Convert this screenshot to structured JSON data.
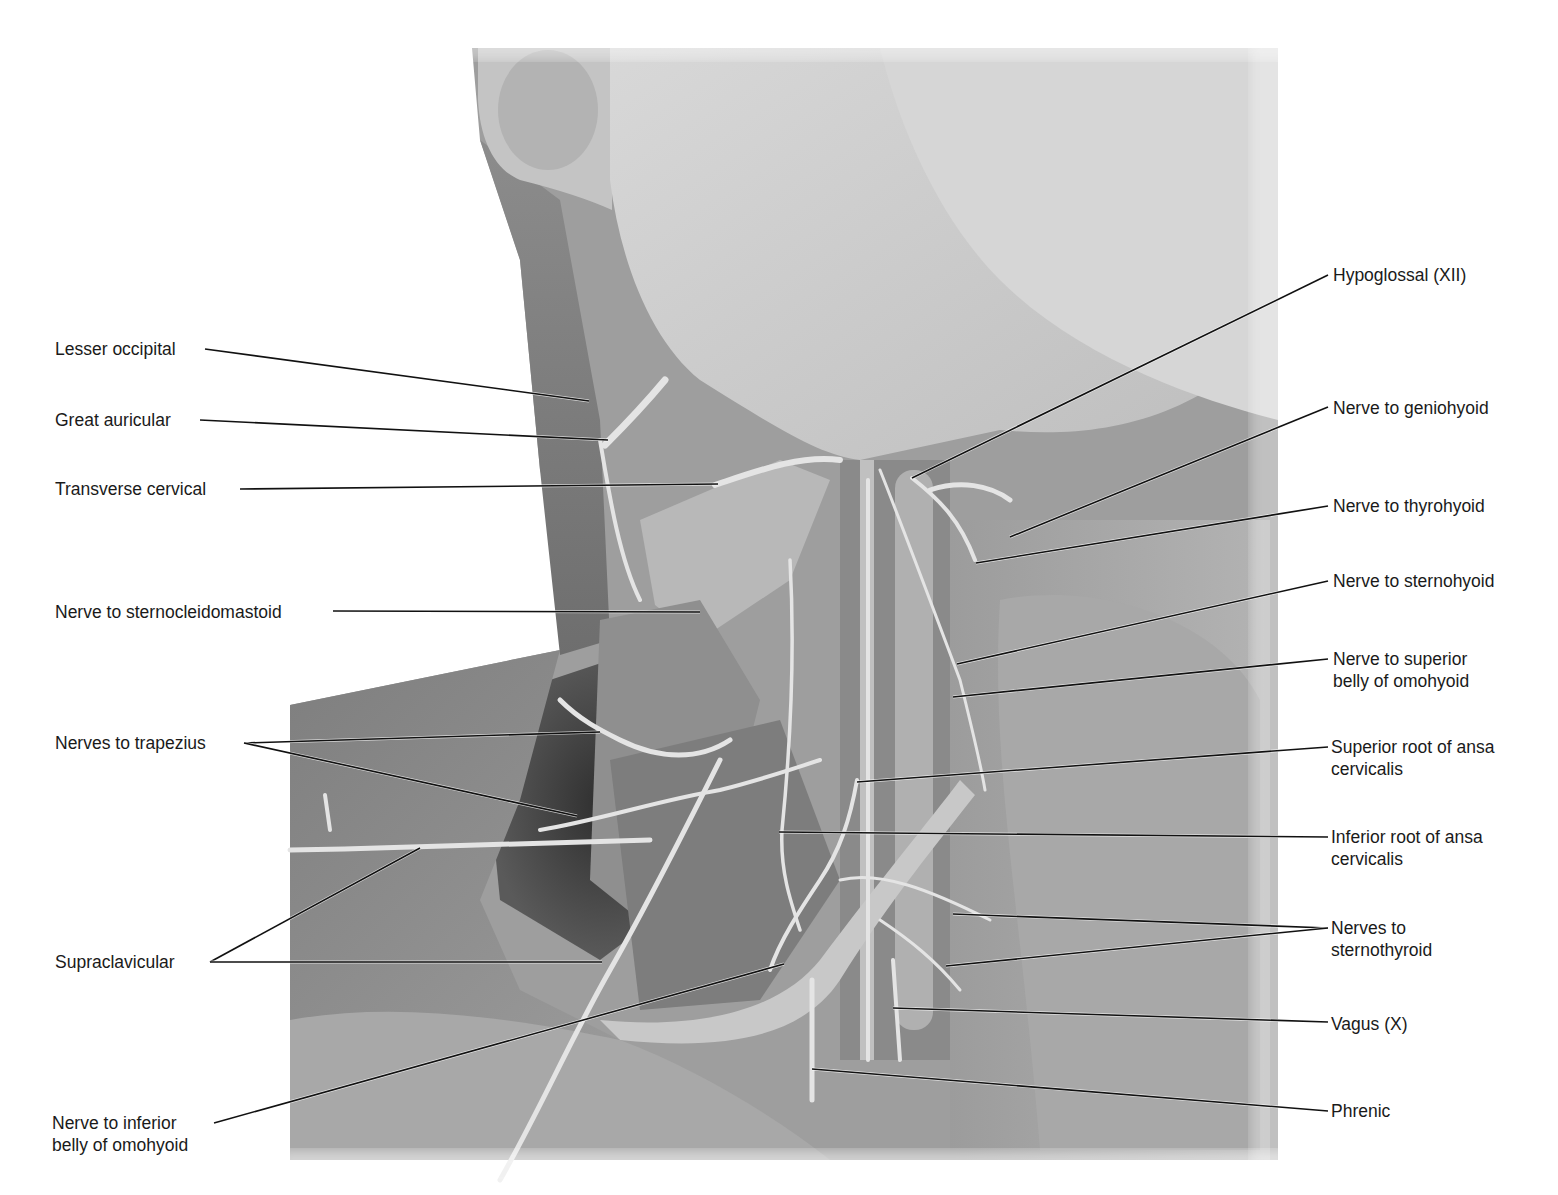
{
  "figure": {
    "style": "grayscale photograph with labeled leader lines",
    "colors": {
      "background": "#ffffff",
      "label_text": "#1a1a1a",
      "leader_line": "#111111",
      "tissue_light": "#c9c9c9",
      "tissue_mid": "#9a9a9a",
      "tissue_dark": "#4a4a4a"
    }
  },
  "labels_left": [
    {
      "id": "lesser-occipital",
      "text": "Lesser occipital",
      "x": 55,
      "y": 338
    },
    {
      "id": "great-auricular",
      "text": "Great auricular",
      "x": 55,
      "y": 409
    },
    {
      "id": "transverse-cervical",
      "text": "Transverse cervical",
      "x": 55,
      "y": 478
    },
    {
      "id": "nerve-to-sternocleidomastoid",
      "text": "Nerve to sternocleidomastoid",
      "x": 55,
      "y": 601
    },
    {
      "id": "nerves-to-trapezius",
      "text": "Nerves to trapezius",
      "x": 55,
      "y": 732
    },
    {
      "id": "supraclavicular",
      "text": "Supraclavicular",
      "x": 55,
      "y": 951
    },
    {
      "id": "nerve-to-inferior-belly-of-omohyoid",
      "line1": "Nerve to inferior",
      "line2": "belly of omohyoid",
      "x": 55,
      "y": 1112
    }
  ],
  "labels_right": [
    {
      "id": "hypoglossal",
      "text": "Hypoglossal (XII)",
      "x": 1333,
      "y": 264
    },
    {
      "id": "nerve-to-geniohyoid",
      "text": "Nerve to geniohyoid",
      "x": 1333,
      "y": 397
    },
    {
      "id": "nerve-to-thyrohyoid",
      "text": "Nerve to thyrohyoid",
      "x": 1333,
      "y": 495
    },
    {
      "id": "nerve-to-sternohyoid",
      "text": "Nerve to sternohyoid",
      "x": 1333,
      "y": 570
    },
    {
      "id": "nerve-to-superior-belly-of-omohyoid",
      "line1": "Nerve to superior",
      "line2": "belly of omohyoid",
      "x": 1333,
      "y": 648
    },
    {
      "id": "superior-root-of-ansa-cervicalis",
      "line1": "Superior root of ansa",
      "line2": "cervicalis",
      "x": 1333,
      "y": 736
    },
    {
      "id": "inferior-root-of-ansa-cervicalis",
      "line1": "Inferior root of ansa",
      "line2": "cervicalis",
      "x": 1333,
      "y": 826
    },
    {
      "id": "nerves-to-sternothyroid",
      "line1": "Nerves to",
      "line2": "sternothyroid",
      "x": 1333,
      "y": 917
    },
    {
      "id": "vagus",
      "text": "Vagus (X)",
      "x": 1333,
      "y": 1013
    },
    {
      "id": "phrenic",
      "text": "Phrenic",
      "x": 1333,
      "y": 1100
    }
  ],
  "leaders": [
    {
      "label": "lesser-occipital",
      "from": [
        205,
        349
      ],
      "to": [
        589,
        401
      ]
    },
    {
      "label": "great-auricular",
      "from": [
        200,
        420
      ],
      "to": [
        608,
        440
      ]
    },
    {
      "label": "transverse-cervical",
      "from": [
        240,
        489
      ],
      "to": [
        718,
        484
      ]
    },
    {
      "label": "nerve-to-sternocleidomastoid",
      "from": [
        333,
        611
      ],
      "to": [
        700,
        612
      ]
    },
    {
      "label": "nerves-to-trapezius",
      "from": [
        244,
        743
      ],
      "to": [
        600,
        732
      ]
    },
    {
      "label": "nerves-to-trapezius",
      "from": [
        244,
        743
      ],
      "to": [
        577,
        816
      ]
    },
    {
      "label": "supraclavicular",
      "from": [
        210,
        962
      ],
      "to": [
        420,
        848
      ]
    },
    {
      "label": "supraclavicular",
      "from": [
        210,
        962
      ],
      "to": [
        602,
        962
      ]
    },
    {
      "label": "nerve-to-inferior-belly-of-omohyoid",
      "from": [
        214,
        1123
      ],
      "to": [
        784,
        964
      ]
    },
    {
      "label": "hypoglossal",
      "from": [
        1328,
        275
      ],
      "to": [
        912,
        478
      ]
    },
    {
      "label": "nerve-to-geniohyoid",
      "from": [
        1328,
        407
      ],
      "to": [
        1010,
        537
      ]
    },
    {
      "label": "nerve-to-thyrohyoid",
      "from": [
        1328,
        506
      ],
      "to": [
        976,
        563
      ]
    },
    {
      "label": "nerve-to-sternohyoid",
      "from": [
        1328,
        581
      ],
      "to": [
        957,
        664
      ]
    },
    {
      "label": "nerve-to-superior-belly-of-omohyoid",
      "from": [
        1328,
        659
      ],
      "to": [
        953,
        697
      ]
    },
    {
      "label": "superior-root-of-ansa-cervicalis",
      "from": [
        1328,
        747
      ],
      "to": [
        857,
        782
      ]
    },
    {
      "label": "inferior-root-of-ansa-cervicalis",
      "from": [
        1328,
        837
      ],
      "to": [
        779,
        832
      ]
    },
    {
      "label": "nerves-to-sternothyroid",
      "from": [
        1328,
        928
      ],
      "to": [
        953,
        914
      ]
    },
    {
      "label": "nerves-to-sternothyroid",
      "from": [
        1328,
        928
      ],
      "to": [
        946,
        966
      ]
    },
    {
      "label": "vagus",
      "from": [
        1328,
        1022
      ],
      "to": [
        893,
        1008
      ]
    },
    {
      "label": "phrenic",
      "from": [
        1328,
        1111
      ],
      "to": [
        812,
        1069
      ]
    }
  ]
}
